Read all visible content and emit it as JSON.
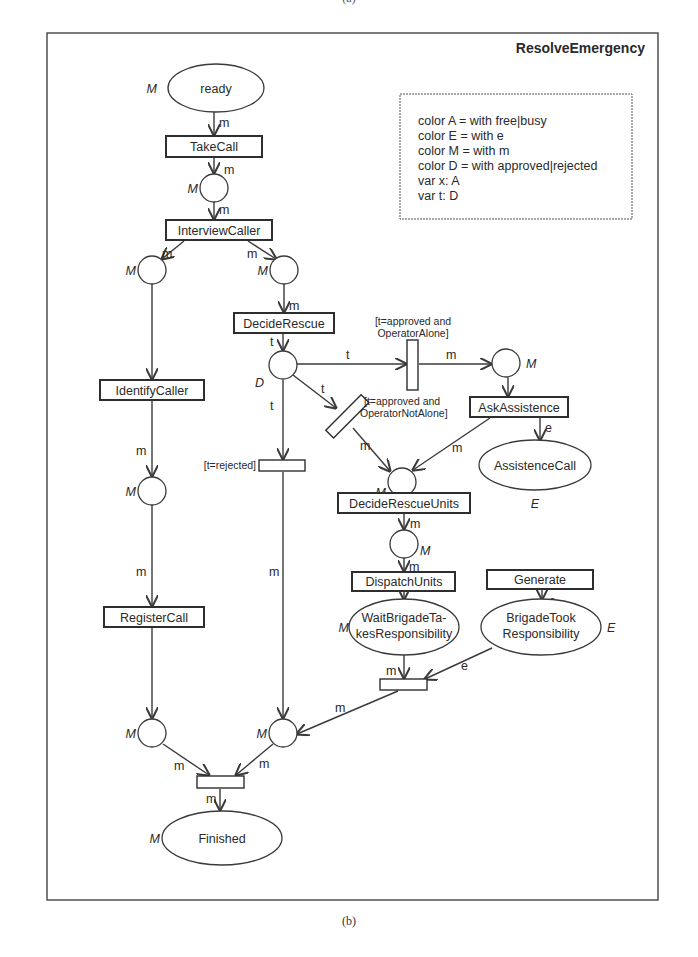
{
  "top_caption": "(a)",
  "caption": "(b)",
  "diagram": {
    "title": "ResolveEmergency",
    "declarations": [
      "color A = with free|busy",
      "color E = with e",
      "color M = with m",
      "color D = with approved|rejected",
      "var x: A",
      "var t: D"
    ],
    "places": {
      "ready": {
        "label": "ready",
        "type": "M"
      },
      "p_takecall": {
        "label": "",
        "type": "M"
      },
      "p_identify_in": {
        "label": "",
        "type": "M"
      },
      "p_decide_in": {
        "label": "",
        "type": "M"
      },
      "p_decision": {
        "label": "",
        "type": "D"
      },
      "p_assist_in": {
        "label": "",
        "type": "M"
      },
      "p_units_in": {
        "label": "",
        "type": "M"
      },
      "p_dispatch_in": {
        "label": "",
        "type": "M"
      },
      "p_register_in": {
        "label": "",
        "type": "M"
      },
      "p_left_end": {
        "label": "",
        "type": "M"
      },
      "p_mid_end": {
        "label": "",
        "type": "M"
      },
      "assistence_call": {
        "label": "AssistenceCall",
        "type": "E"
      },
      "wait_brigade_1": {
        "label": "WaitBrigadeTa-",
        "type": "M"
      },
      "wait_brigade_2": {
        "label": "kesResponsibility"
      },
      "brigade_took_1": {
        "label": "BrigadeTook",
        "type": "E"
      },
      "brigade_took_2": {
        "label": "Responsibility"
      },
      "finished": {
        "label": "Finished",
        "type": "M"
      }
    },
    "transitions": {
      "take_call": "TakeCall",
      "interview_caller": "InterviewCaller",
      "decide_rescue": "DecideRescue",
      "identify_caller": "IdentifyCaller",
      "ask_assistence": "AskAssistence",
      "decide_rescue_units": "DecideRescueUnits",
      "dispatch_units": "DispatchUnits",
      "generate": "Generate",
      "register_call": "RegisterCall"
    },
    "guards": {
      "alone_1": "[t=approved and",
      "alone_2": "OperatorAlone]",
      "not_alone_1": "[t=approved and",
      "not_alone_2": "OperatorNotAlone]",
      "rejected": "[t=rejected]"
    },
    "arc_labels": {
      "m": "m",
      "t": "t",
      "e": "e"
    }
  }
}
